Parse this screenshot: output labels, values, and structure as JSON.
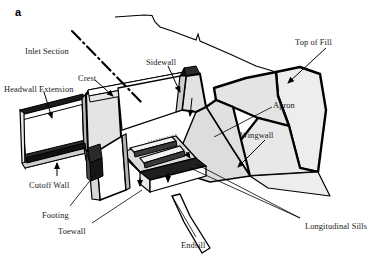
{
  "figure": {
    "panel_letter": "a",
    "colors": {
      "background": "#ffffff",
      "outline": "#000000",
      "fill_light": "#ededed",
      "fill_mid": "#e2e2e2",
      "fill_dark": "#d4d4d4",
      "text": "#1a1a1a"
    }
  },
  "labels": [
    {
      "id": "inlet-section",
      "text": "Inlet Section",
      "x": 25,
      "y": 47
    },
    {
      "id": "crest",
      "text": "Crest",
      "x": 78,
      "y": 74
    },
    {
      "id": "headwall-extension",
      "text": "Headwall Extension",
      "x": 4,
      "y": 85
    },
    {
      "id": "sidewall",
      "text": "Sidewall",
      "x": 146,
      "y": 58
    },
    {
      "id": "top-of-fill",
      "text": "Top of Fill",
      "x": 295,
      "y": 38
    },
    {
      "id": "apron",
      "text": "Apron",
      "x": 273,
      "y": 101
    },
    {
      "id": "wingwall",
      "text": "Wingwall",
      "x": 240,
      "y": 131
    },
    {
      "id": "cutoff-wall",
      "text": "Cutoff Wall",
      "x": 29,
      "y": 181
    },
    {
      "id": "footing",
      "text": "Footing",
      "x": 42,
      "y": 211
    },
    {
      "id": "toewall",
      "text": "Toewall",
      "x": 58,
      "y": 227
    },
    {
      "id": "endsill",
      "text": "Endsill",
      "x": 181,
      "y": 241
    },
    {
      "id": "longitudinal-sills",
      "text": "Longitudinal Sills",
      "x": 305,
      "y": 222
    }
  ]
}
